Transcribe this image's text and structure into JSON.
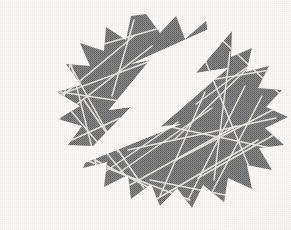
{
  "image": {
    "title": "Lightning Bolt Starburst Logo",
    "description": "Scanned halftone print of a jagged starburst with a white lightning bolt and crack lines",
    "width": 291,
    "height": 230,
    "alt_text": "Gray starburst with white lightning bolt"
  },
  "colors": {
    "background": "#fbfaf8",
    "star_fill": "#7e7e7c",
    "star_fill_light": "#8c8c8a",
    "bolt_fill": "#fbfaf8",
    "crack_stroke": "#e8e7e3",
    "halftone_dark": "#616160"
  },
  "artwork": {
    "star": {
      "name": "starburst-polygon",
      "points": "146,14 160,33 176,16 185,39 206,21 210,46 232,31 231,57 252,48 246,72 269,66 258,88 282,90 266,107 288,117 265,128 284,145 259,148 272,170 247,165 252,189 228,178 224,202 203,185 192,208 177,188 160,206 151,184 131,199 128,175 104,187 107,162 83,168 93,146 68,145 82,126 58,119 80,106 57,92 81,85 66,64 90,66 80,43 104,51 106,27 126,40 131,16",
      "label": "starburst"
    },
    "bolt": {
      "name": "lightning-bolt",
      "points": "249,11 196,73 228,68 160,127 181,124 72,168 131,107 109,110 150,60 131,64",
      "label": "lightning bolt"
    },
    "cracks": [
      {
        "x1": 33,
        "y1": 66,
        "x2": 126,
        "y2": 176
      },
      {
        "x1": 24,
        "y1": 108,
        "x2": 148,
        "y2": 62
      },
      {
        "x1": 57,
        "y1": 41,
        "x2": 118,
        "y2": 152
      },
      {
        "x1": 40,
        "y1": 133,
        "x2": 152,
        "y2": 46
      },
      {
        "x1": 62,
        "y1": 28,
        "x2": 96,
        "y2": 164
      },
      {
        "x1": 20,
        "y1": 86,
        "x2": 140,
        "y2": 104
      },
      {
        "x1": 78,
        "y1": 22,
        "x2": 52,
        "y2": 160
      },
      {
        "x1": 28,
        "y1": 124,
        "x2": 134,
        "y2": 36
      },
      {
        "x1": 95,
        "y1": 160,
        "x2": 150,
        "y2": 188
      },
      {
        "x1": 60,
        "y1": 150,
        "x2": 190,
        "y2": 200
      },
      {
        "x1": 110,
        "y1": 196,
        "x2": 236,
        "y2": 126
      },
      {
        "x1": 148,
        "y1": 204,
        "x2": 258,
        "y2": 140
      },
      {
        "x1": 128,
        "y1": 150,
        "x2": 276,
        "y2": 118
      },
      {
        "x1": 160,
        "y1": 196,
        "x2": 205,
        "y2": 92
      },
      {
        "x1": 188,
        "y1": 200,
        "x2": 245,
        "y2": 86
      },
      {
        "x1": 210,
        "y1": 196,
        "x2": 262,
        "y2": 96
      },
      {
        "x1": 176,
        "y1": 160,
        "x2": 284,
        "y2": 104
      },
      {
        "x1": 198,
        "y1": 178,
        "x2": 286,
        "y2": 128
      },
      {
        "x1": 166,
        "y1": 126,
        "x2": 280,
        "y2": 150
      },
      {
        "x1": 205,
        "y1": 60,
        "x2": 252,
        "y2": 174
      },
      {
        "x1": 230,
        "y1": 52,
        "x2": 214,
        "y2": 180
      },
      {
        "x1": 186,
        "y1": 84,
        "x2": 270,
        "y2": 70
      },
      {
        "x1": 196,
        "y1": 104,
        "x2": 268,
        "y2": 52
      },
      {
        "x1": 174,
        "y1": 140,
        "x2": 256,
        "y2": 60
      },
      {
        "x1": 120,
        "y1": 172,
        "x2": 212,
        "y2": 108
      },
      {
        "x1": 90,
        "y1": 182,
        "x2": 178,
        "y2": 122
      },
      {
        "x1": 104,
        "y1": 44,
        "x2": 160,
        "y2": 28
      },
      {
        "x1": 134,
        "y1": 20,
        "x2": 112,
        "y2": 96
      },
      {
        "x1": 84,
        "y1": 100,
        "x2": 144,
        "y2": 188
      },
      {
        "x1": 46,
        "y1": 152,
        "x2": 120,
        "y2": 118
      },
      {
        "x1": 150,
        "y1": 180,
        "x2": 230,
        "y2": 196
      },
      {
        "x1": 222,
        "y1": 40,
        "x2": 282,
        "y2": 96
      }
    ]
  }
}
